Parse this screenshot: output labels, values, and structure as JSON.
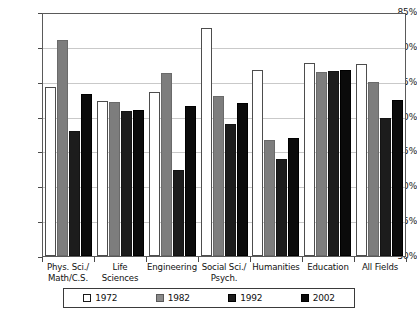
{
  "chart_data": {
    "type": "bar",
    "title": "",
    "xlabel": "",
    "ylabel": "",
    "ylim": [
      50,
      85
    ],
    "ytick_step": 5,
    "grid": true,
    "legend_position": "bottom",
    "categories": [
      "Phys. Sci./\nMath/C.S.",
      "Life Sciences",
      "Engineering",
      "Social Sci./\nPsych.",
      "Humanities",
      "Education",
      "All Fields"
    ],
    "category_lines": [
      [
        "Phys. Sci./",
        "Math/C.S."
      ],
      [
        "Life Sciences",
        ""
      ],
      [
        "Engineering",
        ""
      ],
      [
        "Social Sci./",
        "Psych."
      ],
      [
        "Humanities",
        ""
      ],
      [
        "Education",
        ""
      ],
      [
        "All Fields",
        ""
      ]
    ],
    "ytick_labels": [
      "85%",
      "80%",
      "75%",
      "70%",
      "65%",
      "60%",
      "55%",
      "50%"
    ],
    "ytick_values": [
      85,
      80,
      75,
      70,
      65,
      60,
      55,
      50
    ],
    "series": [
      {
        "name": "1972",
        "color": "#ffffff",
        "values": [
          74.2,
          72.2,
          73.5,
          82.7,
          76.7,
          77.7,
          77.6
        ]
      },
      {
        "name": "1982",
        "color": "#7d7d7d",
        "values": [
          81.0,
          72.1,
          76.3,
          72.9,
          66.6,
          76.4,
          75.0
        ]
      },
      {
        "name": "1992",
        "color": "#1c1c1c",
        "values": [
          68.0,
          70.8,
          62.3,
          69.0,
          63.9,
          76.5,
          69.8
        ]
      },
      {
        "name": "2002",
        "color": "#0b0b0b",
        "values": [
          73.2,
          70.9,
          71.5,
          72.0,
          67.0,
          76.7,
          72.4
        ]
      }
    ]
  },
  "legend": {
    "items": [
      {
        "label": "1972"
      },
      {
        "label": "1982"
      },
      {
        "label": "1992"
      },
      {
        "label": "2002"
      }
    ]
  }
}
